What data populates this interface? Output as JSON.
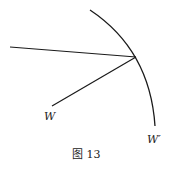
{
  "diagram": {
    "caption": "图 13",
    "labels": {
      "w": "W",
      "w_prime": "W′"
    },
    "stroke_color": "#1a1a1a"
  }
}
